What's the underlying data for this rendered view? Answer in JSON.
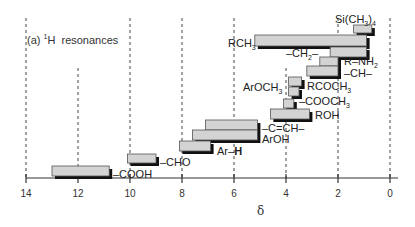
{
  "chart_data": {
    "type": "bar",
    "orientation": "horizontal-range",
    "xlabel": "δ",
    "ylabel": "",
    "xlim": [
      14,
      0
    ],
    "x_reversed": true,
    "x_ticks": [
      14,
      12,
      10,
      8,
      6,
      4,
      2,
      0
    ],
    "grid": "vertical dashed at every 2 ppm",
    "bar_fill": "#d3d3d3",
    "bar_shadow": "#111111",
    "series": [
      {
        "name": "Si(CH3)4",
        "label_html": "Si(CH<sub>3</sub>)<sub>4</sub>",
        "start": 1.4,
        "end": 0.7,
        "label_side": "left-above"
      },
      {
        "name": "RCH3",
        "label_html": "RCH<sub>3</sub>",
        "start": 5.2,
        "end": 0.9,
        "label_side": "left"
      },
      {
        "name": "-CH2-",
        "label_html": "–CH<sub>2</sub>–",
        "start": 2.3,
        "end": 0.9,
        "label_side": "left"
      },
      {
        "name": "R-NH2",
        "label_html": "R–NH<sub>2</sub>",
        "start": 2.7,
        "end": 2.0,
        "label_side": "right"
      },
      {
        "name": "-CH-",
        "label_html": "–CH–",
        "start": 3.2,
        "end": 2.0,
        "label_side": "right"
      },
      {
        "name": "RCOCH3",
        "label_html": "RCOCH<sub>3</sub>",
        "start": 3.9,
        "end": 3.4,
        "label_side": "right"
      },
      {
        "name": "ArOCH3",
        "label_html": "ArOCH<sub>3</sub>",
        "start": 3.9,
        "end": 3.5,
        "label_side": "left"
      },
      {
        "name": "-COOCH3",
        "label_html": "–COOCH<sub>3</sub>",
        "start": 4.1,
        "end": 3.7,
        "label_side": "right"
      },
      {
        "name": "ROH",
        "label_html": "ROH",
        "start": 4.6,
        "end": 3.1,
        "label_side": "right"
      },
      {
        "name": "-C=CH-",
        "label_html": "–C=CH–",
        "start": 7.1,
        "end": 5.1,
        "label_side": "right"
      },
      {
        "name": "ArOH",
        "label_html": "ArOH",
        "start": 7.6,
        "end": 5.1,
        "label_side": "right"
      },
      {
        "name": "Ar-H",
        "label_html": "Ar–<b>H</b>",
        "start": 8.1,
        "end": 6.9,
        "label_side": "right-below"
      },
      {
        "name": "-CHO",
        "label_html": "–CHO",
        "start": 10.1,
        "end": 9.0,
        "label_side": "right"
      },
      {
        "name": "-COOH",
        "label_html": "–COOH",
        "start": 13.0,
        "end": 10.8,
        "label_side": "right"
      }
    ]
  },
  "layout": {
    "x_px_per_unit": 26,
    "x_zero_px": 390,
    "axis_y_px": 178,
    "rows": [
      {
        "y": 25,
        "h": 8,
        "label_x": 335,
        "label_y": 14
      },
      {
        "y": 35,
        "h": 11,
        "label_x": 228,
        "label_y": 38
      },
      {
        "y": 47,
        "h": 10,
        "label_x": 286,
        "label_y": 48
      },
      {
        "y": 57,
        "h": 9,
        "label_x": 344,
        "label_y": 56
      },
      {
        "y": 66,
        "h": 10,
        "label_x": 344,
        "label_y": 68
      },
      {
        "y": 77,
        "h": 9,
        "label_x": 307,
        "label_y": 81
      },
      {
        "y": 87,
        "h": 9,
        "label_x": 243,
        "label_y": 82
      },
      {
        "y": 99,
        "h": 9,
        "label_x": 299,
        "label_y": 96
      },
      {
        "y": 109,
        "h": 10,
        "label_x": 315,
        "label_y": 110
      },
      {
        "y": 120,
        "h": 10,
        "label_x": 262,
        "label_y": 123
      },
      {
        "y": 130,
        "h": 10,
        "label_x": 262,
        "label_y": 134
      },
      {
        "y": 141,
        "h": 10,
        "label_x": 217,
        "label_y": 146
      },
      {
        "y": 154,
        "h": 9,
        "label_x": 160,
        "label_y": 157
      },
      {
        "y": 166,
        "h": 10,
        "label_x": 113,
        "label_y": 169
      }
    ]
  }
}
